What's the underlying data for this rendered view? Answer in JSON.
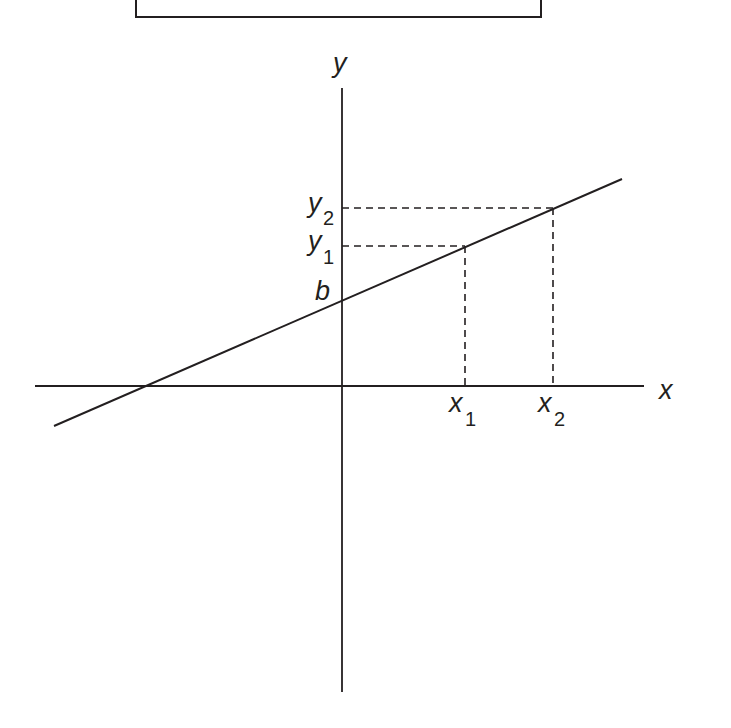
{
  "diagram": {
    "colors": {
      "stroke": "#231f20",
      "background": "#ffffff"
    },
    "axes": {
      "x_label": "x",
      "y_label": "y"
    },
    "intercept_label": "b",
    "points": [
      {
        "x_label": "x",
        "x_sub": "1",
        "y_label": "y",
        "y_sub": "1"
      },
      {
        "x_label": "x",
        "x_sub": "2",
        "y_label": "y",
        "y_sub": "2"
      }
    ]
  }
}
